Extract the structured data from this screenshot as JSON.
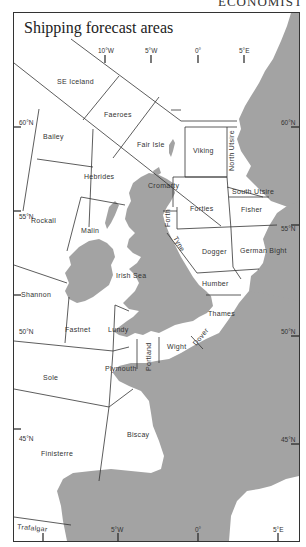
{
  "header": {
    "cut_text": "ECONOMIST"
  },
  "map": {
    "title": "Shipping forecast areas",
    "colors": {
      "land": "#a3a3a3",
      "sea": "#ffffff",
      "boundary": "#333333"
    },
    "longitude_labels_top": [
      "10°W",
      "5°W",
      "0°",
      "5°E"
    ],
    "longitude_labels_bottom": [
      "5°W",
      "0°",
      "5°E"
    ],
    "latitude_labels_left": [
      "60°N",
      "55°N",
      "50°N",
      "45°N"
    ],
    "latitude_labels_right": [
      "60°N",
      "55°N",
      "50°N",
      "45°N"
    ],
    "areas": {
      "se_iceland": "SE Iceland",
      "faeroes": "Faeroes",
      "fair_isle": "Fair Isle",
      "viking": "Viking",
      "north_utsire": "North Utsire",
      "south_utsire": "South Utsire",
      "bailey": "Bailey",
      "hebrides": "Hebrides",
      "cromarty": "Cromarty",
      "forties": "Forties",
      "fisher": "Fisher",
      "forth": "Forth",
      "rockall": "Rockall",
      "malin": "Malin",
      "tyne": "Tyne",
      "dogger": "Dogger",
      "german_bight": "German Bight",
      "irish_sea": "Irish Sea",
      "humber": "Humber",
      "shannon": "Shannon",
      "thames": "Thames",
      "fastnet": "Fastnet",
      "lundy": "Lundy",
      "dover": "Dover",
      "wight": "Wight",
      "portland": "Portland",
      "plymouth": "Plymouth",
      "sole": "Sole",
      "biscay": "Biscay",
      "finisterre": "Finisterre",
      "trafalgar": "Trafalgar"
    }
  }
}
